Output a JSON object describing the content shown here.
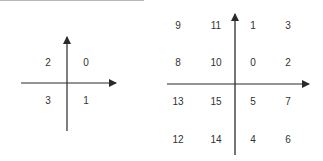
{
  "colors": {
    "axis": "#2a2a2a",
    "text": "#333333",
    "topline": "#b8b8b8"
  },
  "left_diagram": {
    "description": "2D quadrant numbering",
    "quadrants": [
      {
        "label": "2",
        "x": 48,
        "y": 63
      },
      {
        "label": "0",
        "x": 86,
        "y": 63
      },
      {
        "label": "3",
        "x": 48,
        "y": 101
      },
      {
        "label": "1",
        "x": 86,
        "y": 101
      }
    ]
  },
  "right_diagram": {
    "description": "4x4 cell numbering",
    "cells": [
      {
        "label": "9",
        "x": 178,
        "y": 26
      },
      {
        "label": "11",
        "x": 216,
        "y": 26
      },
      {
        "label": "1",
        "x": 253,
        "y": 26
      },
      {
        "label": "3",
        "x": 288,
        "y": 26
      },
      {
        "label": "8",
        "x": 178,
        "y": 63
      },
      {
        "label": "10",
        "x": 216,
        "y": 63
      },
      {
        "label": "0",
        "x": 253,
        "y": 63
      },
      {
        "label": "2",
        "x": 288,
        "y": 63
      },
      {
        "label": "13",
        "x": 178,
        "y": 102
      },
      {
        "label": "15",
        "x": 216,
        "y": 102
      },
      {
        "label": "5",
        "x": 253,
        "y": 102
      },
      {
        "label": "7",
        "x": 288,
        "y": 102
      },
      {
        "label": "12",
        "x": 178,
        "y": 140
      },
      {
        "label": "14",
        "x": 216,
        "y": 140
      },
      {
        "label": "4",
        "x": 253,
        "y": 140
      },
      {
        "label": "6",
        "x": 288,
        "y": 140
      }
    ]
  }
}
